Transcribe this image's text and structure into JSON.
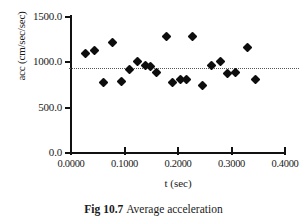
{
  "figure": {
    "caption_label": "Fig 10.7",
    "caption_text": "Average acceleration"
  },
  "chart_data": {
    "type": "scatter",
    "title": "",
    "xlabel": "t (sec)",
    "ylabel": "acc (cm/sec/sec)",
    "xlim": [
      0.0,
      0.4
    ],
    "ylim": [
      0.0,
      1500.0
    ],
    "grid": false,
    "legend": "none",
    "xticks": [
      0.0,
      0.1,
      0.2,
      0.3,
      0.4
    ],
    "xtick_labels": [
      "0.0000",
      "0.1000",
      "0.2000",
      "0.3000",
      "0.4000"
    ],
    "yticks": [
      0.0,
      500.0,
      1000.0,
      1500.0
    ],
    "ytick_labels": [
      "0.0",
      "500.0",
      "1000.0",
      "1500.0"
    ],
    "reference_line": {
      "orientation": "horizontal",
      "value": 940.0,
      "style": "dotted",
      "color": "#555555"
    },
    "marker": {
      "shape": "diamond",
      "color": "#0d0d0d",
      "size": 7
    },
    "series": [
      {
        "name": "average acceleration",
        "x": [
          0.028,
          0.043,
          0.06,
          0.077,
          0.095,
          0.11,
          0.125,
          0.14,
          0.155,
          0.17,
          0.178,
          0.188,
          0.205,
          0.218,
          0.228,
          0.245,
          0.26,
          0.272,
          0.282,
          0.298,
          0.312,
          0.33,
          0.345
        ],
        "y": [
          1100.0,
          1130.0,
          780.0,
          1215.0,
          785.0,
          920.0,
          1005.0,
          970.0,
          890.0,
          1290.0,
          780.0,
          810.0,
          810.0,
          1290.0,
          740.0,
          960.0,
          1010.0,
          880.0,
          890.0,
          1170.0,
          815.0,
          930.0,
          955.0
        ]
      }
    ],
    "points": [
      {
        "x": 0.028,
        "y": 1100.0
      },
      {
        "x": 0.043,
        "y": 1130.0
      },
      {
        "x": 0.06,
        "y": 780.0
      },
      {
        "x": 0.077,
        "y": 1215.0
      },
      {
        "x": 0.095,
        "y": 785.0
      },
      {
        "x": 0.11,
        "y": 920.0
      },
      {
        "x": 0.125,
        "y": 1005.0
      },
      {
        "x": 0.14,
        "y": 970.0
      },
      {
        "x": 0.148,
        "y": 950.0
      },
      {
        "x": 0.16,
        "y": 890.0
      },
      {
        "x": 0.178,
        "y": 1290.0
      },
      {
        "x": 0.19,
        "y": 780.0
      },
      {
        "x": 0.205,
        "y": 810.0
      },
      {
        "x": 0.215,
        "y": 815.0
      },
      {
        "x": 0.228,
        "y": 1290.0
      },
      {
        "x": 0.245,
        "y": 740.0
      },
      {
        "x": 0.262,
        "y": 960.0
      },
      {
        "x": 0.28,
        "y": 1010.0
      },
      {
        "x": 0.292,
        "y": 880.0
      },
      {
        "x": 0.308,
        "y": 890.0
      },
      {
        "x": 0.33,
        "y": 1165.0
      },
      {
        "x": 0.345,
        "y": 815.0
      }
    ]
  }
}
